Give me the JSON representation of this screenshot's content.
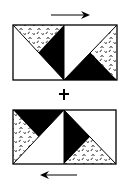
{
  "diagram": {
    "colors": {
      "background": "#ffffff",
      "outline": "#000000",
      "solid": "#000000",
      "texture_fill": "#ffffff",
      "texture_mark": "#000000",
      "arrow": "#000000"
    },
    "top_block": {
      "direction_arrow": "right-arrow",
      "units": [
        {
          "position": "left",
          "fills": [
            "texture",
            "solid",
            "white"
          ]
        },
        {
          "position": "right",
          "fills": [
            "white",
            "solid",
            "texture"
          ]
        }
      ]
    },
    "joiner_symbol": "+",
    "bottom_block": {
      "direction_arrow": "left-arrow",
      "units": [
        {
          "position": "left",
          "fills": [
            "solid",
            "texture",
            "white"
          ]
        },
        {
          "position": "right",
          "fills": [
            "solid",
            "texture",
            "white"
          ]
        }
      ]
    }
  }
}
